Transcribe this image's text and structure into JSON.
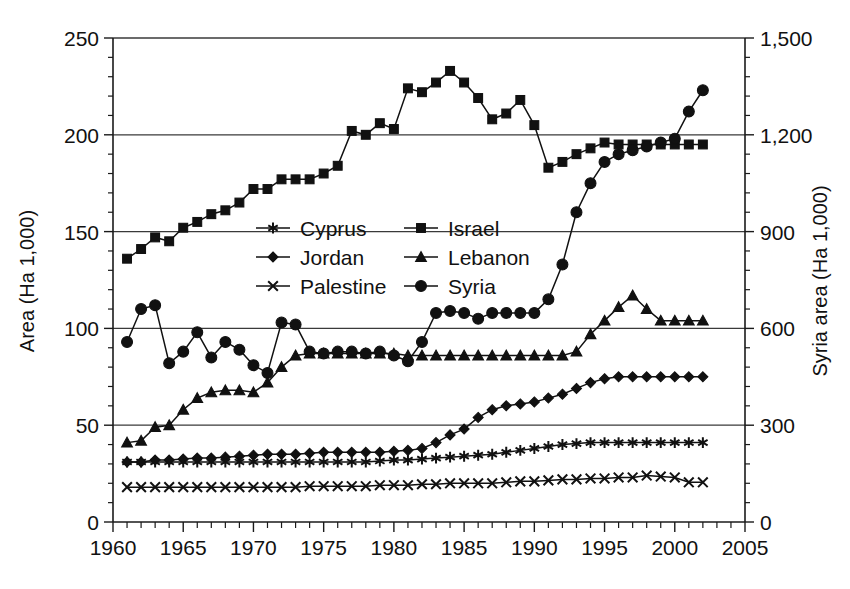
{
  "chart_data": {
    "type": "line",
    "title": "",
    "xlabel": "",
    "ylabel": "Area (Ha 1,000)",
    "y2label": "Syria area (Ha 1,000)",
    "xlim": [
      1960,
      2005
    ],
    "ylim": [
      0,
      250
    ],
    "y2lim": [
      0,
      1500
    ],
    "xticks": [
      1960,
      1965,
      1970,
      1975,
      1980,
      1985,
      1990,
      1995,
      2000,
      2005
    ],
    "xtick_labels": [
      "1960",
      "1965",
      "1970",
      "1975",
      "1980",
      "1985",
      "1990",
      "1995",
      "2000",
      "2005"
    ],
    "yticks": [
      0,
      50,
      100,
      150,
      200,
      250
    ],
    "ytick_labels": [
      "0",
      "50",
      "100",
      "150",
      "200",
      "250"
    ],
    "y2ticks": [
      0,
      300,
      600,
      900,
      1200,
      1500
    ],
    "y2tick_labels": [
      "0",
      "300",
      "600",
      "900",
      "1,200",
      "1,500"
    ],
    "x_minor_interval": 1,
    "y_minor_interval": 10,
    "grid": true,
    "grid_axis": "y",
    "legend_position": "center-upper",
    "legend_columns": 2,
    "legend_order": [
      "Cyprus",
      "Israel",
      "Jordan",
      "Lebanon",
      "Palestine",
      "Syria"
    ],
    "x": [
      1961,
      1962,
      1963,
      1964,
      1965,
      1966,
      1967,
      1968,
      1969,
      1970,
      1971,
      1972,
      1973,
      1974,
      1975,
      1976,
      1977,
      1978,
      1979,
      1980,
      1981,
      1982,
      1983,
      1984,
      1985,
      1986,
      1987,
      1988,
      1989,
      1990,
      1991,
      1992,
      1993,
      1994,
      1995,
      1996,
      1997,
      1998,
      1999,
      2000,
      2001,
      2002
    ],
    "series": [
      {
        "name": "Cyprus",
        "marker": "star",
        "axis": "left",
        "values": [
          31,
          31,
          31,
          31,
          31,
          31,
          31,
          31,
          31,
          31,
          31,
          31,
          31,
          31,
          31,
          31,
          31,
          31,
          31.5,
          32,
          32,
          32.5,
          33,
          33.5,
          34,
          34.5,
          35,
          36,
          37,
          38,
          39,
          40,
          40.5,
          41,
          41,
          41,
          41,
          41,
          41,
          41,
          41,
          41
        ]
      },
      {
        "name": "Israel",
        "marker": "square",
        "axis": "left",
        "values": [
          136,
          141,
          147,
          145,
          152,
          155,
          159,
          161,
          165,
          172,
          172,
          177,
          177,
          177,
          180,
          184,
          202,
          200,
          206,
          203,
          224,
          222,
          227,
          233,
          227,
          219,
          208,
          211,
          218,
          205,
          183,
          186,
          190,
          193,
          196,
          195,
          195,
          195,
          195,
          195,
          195,
          195
        ]
      },
      {
        "name": "Jordan",
        "marker": "diamond",
        "axis": "left",
        "values": [
          31,
          31,
          32,
          32,
          32.5,
          33,
          33,
          33.5,
          34,
          34.5,
          35,
          35,
          35,
          35.5,
          36,
          36,
          36,
          36,
          36,
          36.5,
          37,
          38,
          41,
          45,
          48,
          54,
          58,
          60,
          61,
          62,
          64,
          66,
          69,
          72,
          74,
          75,
          75,
          75,
          75,
          75,
          75,
          75
        ]
      },
      {
        "name": "Lebanon",
        "marker": "triangle",
        "axis": "left",
        "values": [
          41,
          42,
          49,
          50,
          58,
          64,
          67,
          68,
          68,
          67,
          72,
          80,
          86,
          87,
          87,
          87,
          87,
          87,
          87,
          87,
          86,
          86,
          86,
          86,
          86,
          86,
          86,
          86,
          86,
          86,
          86,
          86,
          88,
          97,
          104,
          111,
          117,
          110,
          104,
          104,
          104,
          104
        ]
      },
      {
        "name": "Palestine",
        "marker": "cross",
        "axis": "left",
        "values": [
          18,
          18,
          18,
          18,
          18,
          18,
          18,
          18,
          18,
          18,
          18,
          18,
          18,
          18.5,
          18.5,
          18.5,
          18.5,
          18.5,
          19,
          19,
          19,
          19.5,
          19.5,
          20,
          20,
          20,
          20,
          20.5,
          21,
          21,
          21.5,
          22,
          22,
          22.5,
          22.5,
          23,
          23,
          24,
          23.5,
          23,
          20.5,
          20.5
        ]
      },
      {
        "name": "Syria",
        "marker": "circle",
        "axis": "right",
        "values_right": [
          558,
          660,
          672,
          492,
          528,
          588,
          510,
          558,
          534,
          486,
          462,
          618,
          612,
          528,
          522,
          528,
          528,
          522,
          528,
          516,
          498,
          558,
          648,
          654,
          648,
          630,
          648,
          648,
          648,
          648,
          690,
          798,
          960,
          1050,
          1116,
          1140,
          1152,
          1164,
          1176,
          1188,
          1272,
          1338
        ],
        "values": [
          93,
          110,
          112,
          82,
          88,
          98,
          85,
          93,
          89,
          81,
          77,
          103,
          102,
          88,
          87,
          88,
          88,
          87,
          88,
          86,
          83,
          93,
          108,
          109,
          108,
          105,
          108,
          108,
          108,
          108,
          115,
          133,
          160,
          175,
          186,
          190,
          192,
          194,
          196,
          198,
          212,
          223
        ]
      }
    ]
  }
}
